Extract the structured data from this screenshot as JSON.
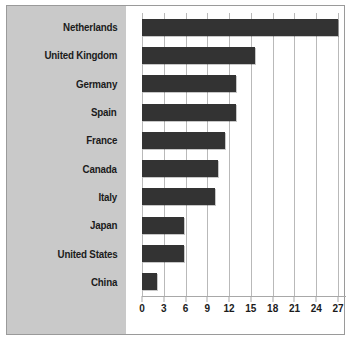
{
  "chart_data": {
    "type": "bar",
    "orientation": "horizontal",
    "title": "",
    "subtitle": "",
    "xlabel": "",
    "ylabel": "",
    "categories": [
      "Netherlands",
      "United Kingdom",
      "Germany",
      "Spain",
      "France",
      "Canada",
      "Italy",
      "Japan",
      "United States",
      "China"
    ],
    "values": [
      27,
      15.5,
      13,
      13,
      11.5,
      10.5,
      10,
      5.8,
      5.8,
      2
    ],
    "xlim": [
      0,
      27
    ],
    "xticks": [
      0,
      3,
      6,
      9,
      12,
      15,
      18,
      21,
      24,
      27
    ],
    "xtick_labels": [
      "0",
      "3",
      "6",
      "9",
      "12",
      "15",
      "18",
      "21",
      "24",
      "27"
    ],
    "grid": "vertical",
    "legend": null,
    "bar_color": "#333333",
    "plot_background": "#ffffff",
    "label_panel_background": "#c9c9c9",
    "gridline_color": "#b9b9b9",
    "border_color": "#9a9a9a",
    "text_color": "#1b1b1b"
  }
}
